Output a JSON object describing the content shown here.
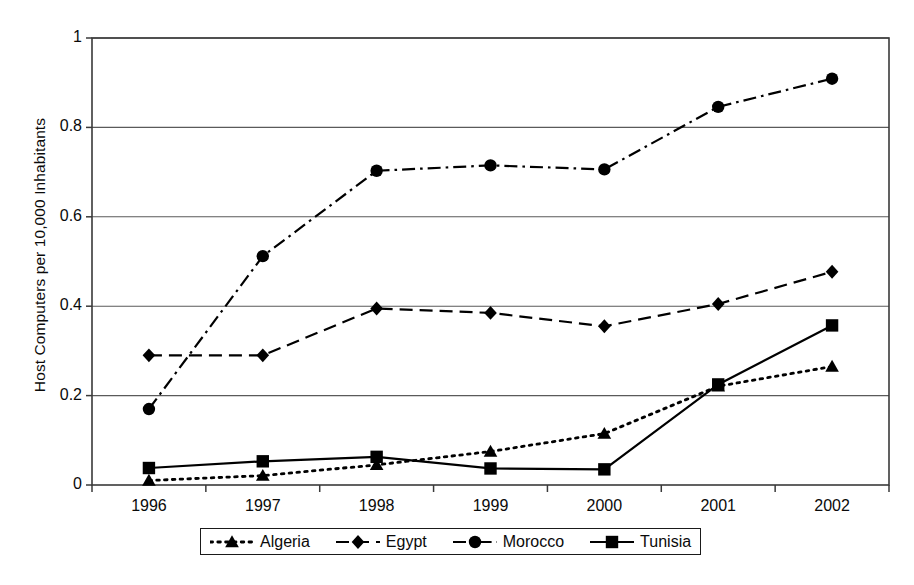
{
  "chart_data": {
    "type": "line",
    "title": "",
    "xlabel": "",
    "ylabel": "Host Computers per 10,000 Inhabitants",
    "categories": [
      "1996",
      "1997",
      "1998",
      "1999",
      "2000",
      "2001",
      "2002"
    ],
    "ylim": [
      0,
      1
    ],
    "yticks": [
      "0",
      "0.2",
      "0.4",
      "0.6",
      "0.8",
      "1"
    ],
    "ytick_values": [
      0,
      0.2,
      0.4,
      0.6,
      0.8,
      1
    ],
    "grid": "horizontal",
    "legend_position": "bottom",
    "series": [
      {
        "name": "Algeria",
        "marker": "triangle",
        "linestyle": "dotted",
        "color": "#000000",
        "values": [
          0.01,
          0.021,
          0.045,
          0.075,
          0.115,
          0.221,
          0.265
        ]
      },
      {
        "name": "Egypt",
        "marker": "diamond",
        "linestyle": "dashed",
        "color": "#000000",
        "values": [
          0.29,
          0.29,
          0.395,
          0.385,
          0.355,
          0.405,
          0.477
        ]
      },
      {
        "name": "Morocco",
        "marker": "circle",
        "linestyle": "dash-dot",
        "color": "#000000",
        "values": [
          0.17,
          0.512,
          0.703,
          0.715,
          0.706,
          0.846,
          0.909
        ]
      },
      {
        "name": "Tunisia",
        "marker": "square",
        "linestyle": "solid",
        "color": "#000000",
        "values": [
          0.038,
          0.053,
          0.063,
          0.037,
          0.035,
          0.225,
          0.357
        ]
      }
    ]
  },
  "colors": {
    "ink": "#000000",
    "frame": "#3a3a3a",
    "grid": "#5a5a5a",
    "background": "#ffffff"
  }
}
